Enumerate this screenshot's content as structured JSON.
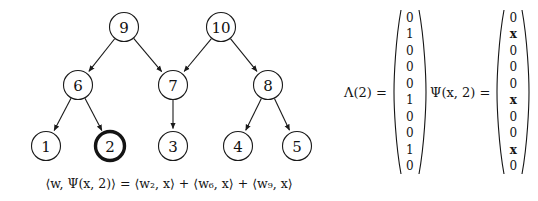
{
  "figure": {
    "background_color": "#ffffff",
    "node_stroke_color": "#1a1a1a",
    "highlight_color": "#141414",
    "text_color": "#141414"
  },
  "tree": {
    "nodes": [
      {
        "id": "node-9",
        "label": "9",
        "cx": 124,
        "cy": 27,
        "r": 14.5,
        "highlighted": false
      },
      {
        "id": "node-10",
        "label": "10",
        "cx": 221,
        "cy": 27,
        "r": 14.5,
        "highlighted": false
      },
      {
        "id": "node-6",
        "label": "6",
        "cx": 78,
        "cy": 85,
        "r": 14.5,
        "highlighted": false
      },
      {
        "id": "node-7",
        "label": "7",
        "cx": 173,
        "cy": 85,
        "r": 14.5,
        "highlighted": false
      },
      {
        "id": "node-8",
        "label": "8",
        "cx": 268,
        "cy": 85,
        "r": 14.5,
        "highlighted": false
      },
      {
        "id": "node-1",
        "label": "1",
        "cx": 46,
        "cy": 146,
        "r": 14.5,
        "highlighted": false
      },
      {
        "id": "node-2",
        "label": "2",
        "cx": 110,
        "cy": 146,
        "r": 14.5,
        "highlighted": true
      },
      {
        "id": "node-3",
        "label": "3",
        "cx": 173,
        "cy": 146,
        "r": 14.5,
        "highlighted": false
      },
      {
        "id": "node-4",
        "label": "4",
        "cx": 238,
        "cy": 146,
        "r": 14.5,
        "highlighted": false
      },
      {
        "id": "node-5",
        "label": "5",
        "cx": 297,
        "cy": 146,
        "r": 14.5,
        "highlighted": false
      }
    ],
    "edges": [
      {
        "from": "node-9",
        "to": "node-6"
      },
      {
        "from": "node-9",
        "to": "node-7"
      },
      {
        "from": "node-10",
        "to": "node-7"
      },
      {
        "from": "node-10",
        "to": "node-8"
      },
      {
        "from": "node-6",
        "to": "node-1"
      },
      {
        "from": "node-6",
        "to": "node-2"
      },
      {
        "from": "node-7",
        "to": "node-3"
      },
      {
        "from": "node-8",
        "to": "node-4"
      },
      {
        "from": "node-8",
        "to": "node-5"
      }
    ]
  },
  "caption": {
    "text": "⟨w, Ψ(x, 2)⟩ = ⟨w₂, x⟩ + ⟨w₆, x⟩ + ⟨w₉, x⟩"
  },
  "lambda_vector": {
    "label": "Λ(2) =",
    "entries": [
      "0",
      "1",
      "0",
      "0",
      "0",
      "1",
      "0",
      "0",
      "1",
      "0"
    ]
  },
  "psi_vector": {
    "label": "Ψ(x, 2) =",
    "entries": [
      "0",
      "x",
      "0",
      "0",
      "0",
      "x",
      "0",
      "0",
      "x",
      "0"
    ]
  }
}
